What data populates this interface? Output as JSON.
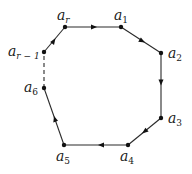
{
  "diagram": {
    "type": "directed-cycle-polygon",
    "colors": {
      "stroke": "#2a2a2a",
      "node": "#111111",
      "background": "#ffffff"
    },
    "nodes": [
      {
        "id": "ar",
        "base": "a",
        "sub": "r",
        "x": 65,
        "y": 27
      },
      {
        "id": "a1",
        "base": "a",
        "sub": "1",
        "x": 121,
        "y": 27
      },
      {
        "id": "a2",
        "base": "a",
        "sub": "2",
        "x": 161,
        "y": 53
      },
      {
        "id": "a3",
        "base": "a",
        "sub": "3",
        "x": 161,
        "y": 118
      },
      {
        "id": "a4",
        "base": "a",
        "sub": "4",
        "x": 128,
        "y": 145
      },
      {
        "id": "a5",
        "base": "a",
        "sub": "5",
        "x": 64,
        "y": 145
      },
      {
        "id": "a6",
        "base": "a",
        "sub": "6",
        "x": 44,
        "y": 88
      },
      {
        "id": "ar1",
        "base": "a",
        "sub": "r − 1",
        "x": 44,
        "y": 52
      }
    ],
    "edges": [
      {
        "from": "ar",
        "to": "a1",
        "style": "solid",
        "arrow": true
      },
      {
        "from": "a1",
        "to": "a2",
        "style": "solid",
        "arrow": true
      },
      {
        "from": "a2",
        "to": "a3",
        "style": "solid",
        "arrow": true
      },
      {
        "from": "a3",
        "to": "a4",
        "style": "solid",
        "arrow": true
      },
      {
        "from": "a4",
        "to": "a5",
        "style": "solid",
        "arrow": true
      },
      {
        "from": "a5",
        "to": "a6",
        "style": "solid",
        "arrow": true
      },
      {
        "from": "a6",
        "to": "ar1",
        "style": "dashed",
        "arrow": false
      },
      {
        "from": "ar1",
        "to": "ar",
        "style": "solid",
        "arrow": true
      }
    ],
    "labels": {
      "ar": {
        "base": "a",
        "sub": "r"
      },
      "a1": {
        "base": "a",
        "sub": "1"
      },
      "a2": {
        "base": "a",
        "sub": "2"
      },
      "a3": {
        "base": "a",
        "sub": "3"
      },
      "a4": {
        "base": "a",
        "sub": "4"
      },
      "a5": {
        "base": "a",
        "sub": "5"
      },
      "a6": {
        "base": "a",
        "sub": "6"
      },
      "ar1": {
        "base": "a",
        "sub": "r − 1"
      }
    }
  }
}
